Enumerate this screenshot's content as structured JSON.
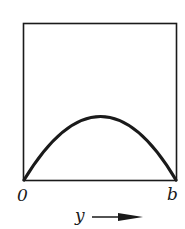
{
  "diagram": {
    "type": "function-plot-in-box",
    "curve": "parabolic arch from 0 to b",
    "labels": {
      "origin": "0",
      "end": "b",
      "axis": "y"
    },
    "colors": {
      "line": "#1a1a1a",
      "background": "#ffffff"
    }
  }
}
